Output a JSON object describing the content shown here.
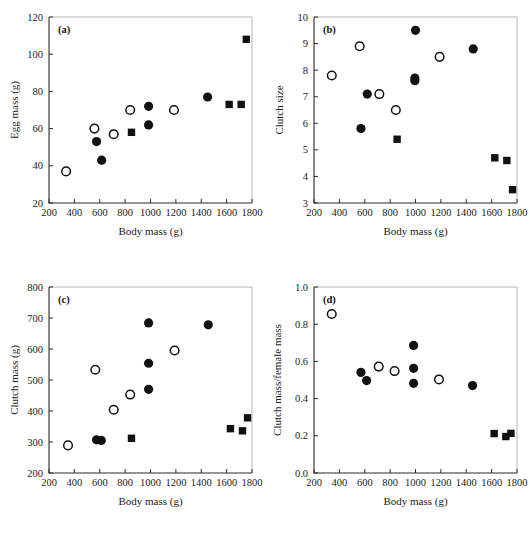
{
  "figure": {
    "title": "",
    "panel_count": 4,
    "marker_legend": {
      "filled-circle": "filled circle",
      "open-circle": "open circle",
      "filled-square": "filled square"
    }
  },
  "chart_data": [
    {
      "id": "a",
      "panel_label": "(a)",
      "type": "scatter",
      "title": "",
      "xlabel": "Body mass (g)",
      "ylabel": "Egg mass (g)",
      "xlim": [
        200,
        1800
      ],
      "ylim": [
        20,
        120
      ],
      "xticks": [
        200,
        400,
        600,
        800,
        1000,
        1200,
        1400,
        1600,
        1800
      ],
      "yticks": [
        20,
        40,
        60,
        80,
        100,
        120
      ],
      "grid": false,
      "legend": "none",
      "series": [
        {
          "name": "open-circle",
          "marker": "open-circle",
          "points": [
            {
              "x": 335,
              "y": 37
            },
            {
              "x": 558,
              "y": 60
            },
            {
              "x": 710,
              "y": 57
            },
            {
              "x": 840,
              "y": 70
            },
            {
              "x": 1185,
              "y": 70
            }
          ]
        },
        {
          "name": "filled-circle",
          "marker": "filled-circle",
          "points": [
            {
              "x": 575,
              "y": 53
            },
            {
              "x": 615,
              "y": 43
            },
            {
              "x": 985,
              "y": 72
            },
            {
              "x": 985,
              "y": 62
            },
            {
              "x": 1450,
              "y": 77
            }
          ]
        },
        {
          "name": "filled-square",
          "marker": "filled-square",
          "points": [
            {
              "x": 850,
              "y": 58
            },
            {
              "x": 1620,
              "y": 73
            },
            {
              "x": 1715,
              "y": 73
            },
            {
              "x": 1755,
              "y": 108
            }
          ]
        }
      ]
    },
    {
      "id": "b",
      "panel_label": "(b)",
      "type": "scatter",
      "title": "",
      "xlabel": "Body mass (g)",
      "ylabel": "Clutch size",
      "xlim": [
        200,
        1800
      ],
      "ylim": [
        3,
        10
      ],
      "xticks": [
        200,
        400,
        600,
        800,
        1000,
        1200,
        1400,
        1600,
        1800
      ],
      "yticks": [
        3,
        4,
        5,
        6,
        7,
        8,
        9,
        10
      ],
      "grid": false,
      "legend": "none",
      "series": [
        {
          "name": "open-circle",
          "marker": "open-circle",
          "points": [
            {
              "x": 340,
              "y": 7.8
            },
            {
              "x": 560,
              "y": 8.9
            },
            {
              "x": 715,
              "y": 7.1
            },
            {
              "x": 845,
              "y": 6.5
            },
            {
              "x": 1190,
              "y": 8.5
            }
          ]
        },
        {
          "name": "filled-circle",
          "marker": "filled-circle",
          "points": [
            {
              "x": 570,
              "y": 5.8
            },
            {
              "x": 620,
              "y": 7.1
            },
            {
              "x": 1000,
              "y": 9.5
            },
            {
              "x": 995,
              "y": 7.7
            },
            {
              "x": 995,
              "y": 7.6
            },
            {
              "x": 1455,
              "y": 8.8
            }
          ]
        },
        {
          "name": "filled-square",
          "marker": "filled-square",
          "points": [
            {
              "x": 855,
              "y": 5.4
            },
            {
              "x": 1625,
              "y": 4.7
            },
            {
              "x": 1720,
              "y": 4.6
            },
            {
              "x": 1765,
              "y": 3.5
            }
          ]
        }
      ]
    },
    {
      "id": "c",
      "panel_label": "(c)",
      "type": "scatter",
      "title": "",
      "xlabel": "Body mass (g)",
      "ylabel": "Clutch mass (g)",
      "xlim": [
        200,
        1800
      ],
      "ylim": [
        200,
        800
      ],
      "xticks": [
        200,
        400,
        600,
        800,
        1000,
        1200,
        1400,
        1600,
        1800
      ],
      "yticks": [
        200,
        300,
        400,
        500,
        600,
        700,
        800
      ],
      "grid": false,
      "legend": "none",
      "series": [
        {
          "name": "open-circle",
          "marker": "open-circle",
          "points": [
            {
              "x": 350,
              "y": 289
            },
            {
              "x": 565,
              "y": 533
            },
            {
              "x": 710,
              "y": 404
            },
            {
              "x": 840,
              "y": 453
            },
            {
              "x": 1190,
              "y": 595
            }
          ]
        },
        {
          "name": "filled-circle",
          "marker": "filled-circle",
          "points": [
            {
              "x": 575,
              "y": 307
            },
            {
              "x": 612,
              "y": 305
            },
            {
              "x": 985,
              "y": 684
            },
            {
              "x": 985,
              "y": 554
            },
            {
              "x": 985,
              "y": 470
            },
            {
              "x": 1455,
              "y": 678
            }
          ]
        },
        {
          "name": "filled-square",
          "marker": "filled-square",
          "points": [
            {
              "x": 850,
              "y": 312
            },
            {
              "x": 1630,
              "y": 343
            },
            {
              "x": 1725,
              "y": 336
            },
            {
              "x": 1765,
              "y": 378
            }
          ]
        }
      ]
    },
    {
      "id": "d",
      "panel_label": "(d)",
      "type": "scatter",
      "title": "",
      "xlabel": "Body mass (g)",
      "ylabel": "Clutch mass/female mass",
      "xlim": [
        200,
        1800
      ],
      "ylim": [
        0.0,
        1.0
      ],
      "xticks": [
        200,
        400,
        600,
        800,
        1000,
        1200,
        1400,
        1600,
        1800
      ],
      "yticks": [
        0.0,
        0.2,
        0.4,
        0.6,
        0.8,
        1.0
      ],
      "grid": false,
      "legend": "none",
      "series": [
        {
          "name": "open-circle",
          "marker": "open-circle",
          "points": [
            {
              "x": 340,
              "y": 0.855
            },
            {
              "x": 710,
              "y": 0.572
            },
            {
              "x": 835,
              "y": 0.548
            },
            {
              "x": 1185,
              "y": 0.503
            }
          ]
        },
        {
          "name": "filled-circle",
          "marker": "filled-circle",
          "points": [
            {
              "x": 570,
              "y": 0.541
            },
            {
              "x": 615,
              "y": 0.497
            },
            {
              "x": 985,
              "y": 0.686
            },
            {
              "x": 985,
              "y": 0.563
            },
            {
              "x": 985,
              "y": 0.482
            },
            {
              "x": 1450,
              "y": 0.47
            }
          ]
        },
        {
          "name": "filled-square",
          "marker": "filled-square",
          "points": [
            {
              "x": 1620,
              "y": 0.212
            },
            {
              "x": 1712,
              "y": 0.196
            },
            {
              "x": 1752,
              "y": 0.213
            }
          ]
        }
      ]
    }
  ]
}
